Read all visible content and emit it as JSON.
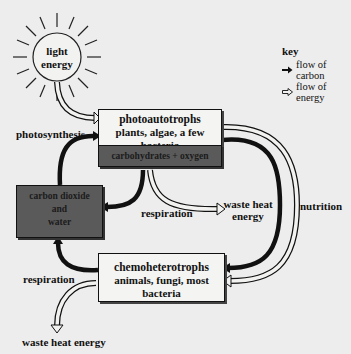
{
  "diagram": {
    "sun": {
      "label_line1": "light",
      "label_line2": "energy"
    },
    "key": {
      "title": "key",
      "items": [
        {
          "icon": "solid-arrow-icon",
          "label": "flow of carbon"
        },
        {
          "icon": "hollow-arrow-icon",
          "label": "flow of energy"
        }
      ]
    },
    "photoautotrophs": {
      "title": "photoautotrophs",
      "subtitle": "plants, algae, a few bacteria",
      "product": "carbohydrates + oxygen"
    },
    "inputs_box": {
      "line1": "carbon dioxide",
      "line2": "and",
      "line3": "water"
    },
    "chemoheterotrophs": {
      "title": "chemoheterotrophs",
      "subtitle": "animals, fungi, most bacteria"
    },
    "labels": {
      "photosynthesis": "photosynthesis",
      "respiration_upper": "respiration",
      "waste_heat_upper_line1": "waste heat",
      "waste_heat_upper_line2": "energy",
      "nutrition": "nutrition",
      "respiration_lower": "respiration",
      "waste_heat_lower": "waste heat energy"
    },
    "colors": {
      "background": "#ededed",
      "box_light": "#f4f4f2",
      "box_dark": "#5a5a5a",
      "ink": "#111111"
    }
  }
}
